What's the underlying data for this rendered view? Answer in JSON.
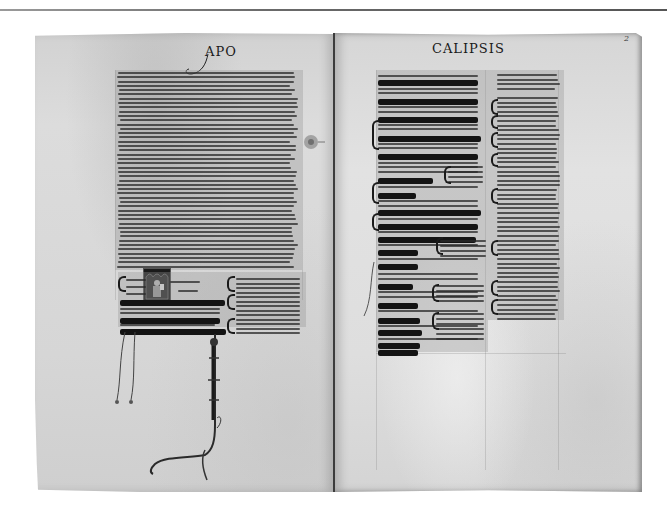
{
  "image": {
    "subject": "Open medieval illuminated manuscript, Apocalypse with gloss",
    "background": "#ffffff",
    "colors": {
      "parchment": "#d8d8d8",
      "ink": "#1a1a1a",
      "spine": "#3c3c3c",
      "rule": "#6a6a6a"
    }
  },
  "left_page": {
    "running_head": "APO",
    "has_historiated_initial": true,
    "has_decorative_flourish": true
  },
  "right_page": {
    "running_head": "CALIPSIS",
    "folio_number": "2",
    "main_text_lines": [
      "gelum suum seruo suo iohanni",
      "qui testimonium perhibuit u",
      "bo dei et testimonium ihu xpi",
      "Beatus qui legit et qui audit uer",
      "ba prophetie huius et seruat ea que in",
      "ea scripta sunt tempus",
      "enim prope est",
      "septem ecclesiis que sunt in asia",
      "Gratia uobis et pax ab eo qui est",
      "et qui erat et qui uenturus est",
      "Et a septem spi",
      "ritibus qui in co",
      "spectu throni eius",
      "et ab ihu",
      "xpo qui est tes",
      "tis fidelis primo",
      "genitus mortuo",
      "rum et princeps"
    ]
  },
  "left_page_bottom_lines": [
    "xpi quam debet deus illi palam fa",
    "cere seruis suis que oportet fieri",
    "cito et significauit mittens per an"
  ]
}
